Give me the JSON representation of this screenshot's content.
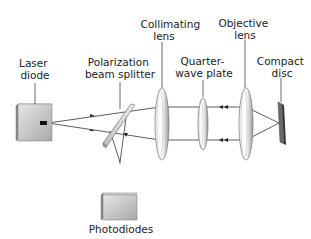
{
  "diagram": {
    "labels": {
      "laser_diode": [
        "Laser",
        "diode"
      ],
      "beam_splitter": [
        "Polarization",
        "beam splitter"
      ],
      "collimating_lens": [
        "Collimating",
        "lens"
      ],
      "quarter_wave_plate": [
        "Quarter-",
        "wave plate"
      ],
      "objective_lens": [
        "Objective",
        "lens"
      ],
      "compact_disc": [
        "Compact",
        "disc"
      ],
      "photodiodes": [
        "Photodiodes"
      ]
    },
    "components": [
      "laser-diode",
      "polarization-beam-splitter",
      "collimating-lens",
      "quarter-wave-plate",
      "objective-lens",
      "compact-disc",
      "photodiodes"
    ]
  }
}
